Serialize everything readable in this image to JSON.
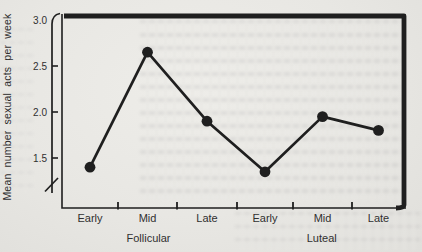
{
  "chart_data": {
    "type": "line",
    "title": "",
    "xlabel": "",
    "ylabel": "Mean number sexual acts per week",
    "categories": [
      "Early",
      "Mid",
      "Late",
      "Early",
      "Mid",
      "Late"
    ],
    "values": [
      1.4,
      2.65,
      1.9,
      1.35,
      1.95,
      1.8
    ],
    "groups": [
      {
        "label": "Follicular",
        "from": 0,
        "to": 2
      },
      {
        "label": "Luteal",
        "from": 3,
        "to": 5
      }
    ],
    "y_ticks": [
      {
        "value": 3.0,
        "label": "3.0"
      },
      {
        "value": 2.5,
        "label": "2.5"
      },
      {
        "value": 2.0,
        "label": "2.0"
      },
      {
        "value": 1.5,
        "label": "1.5"
      }
    ],
    "ylim": [
      1.5,
      3.0
    ],
    "axis_break": true,
    "legend": "none",
    "grid": "off",
    "marker": "filled-circle",
    "ink_color": "#1f1f1f",
    "text_color": "#303030",
    "paper_color": "#e8e7e3"
  }
}
